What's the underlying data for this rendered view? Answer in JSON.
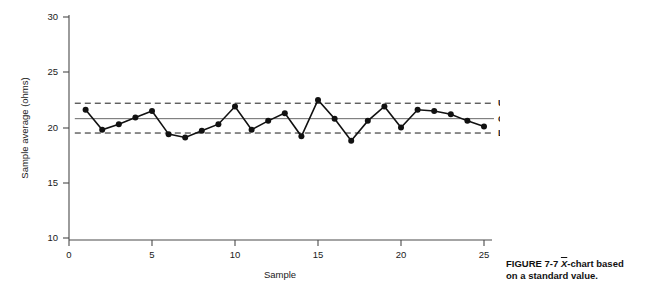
{
  "caption": {
    "figure_number": "FIGURE 7-7",
    "symbol": "X",
    "text_after_symbol": "-chart based",
    "line2": "on a standard value."
  },
  "chart_data": {
    "type": "line",
    "title": "",
    "xlabel": "Sample",
    "ylabel": "Sample average (ohms)",
    "xlim": [
      0,
      25.8
    ],
    "ylim": [
      10,
      30
    ],
    "xticks": [
      0,
      5,
      10,
      15,
      20,
      25
    ],
    "xtick_labels": [
      "0",
      "5",
      "10",
      "15",
      "20",
      "25"
    ],
    "yticks": [
      10,
      15,
      20,
      25,
      30
    ],
    "ytick_labels": [
      "10",
      "15",
      "20",
      "25",
      "30"
    ],
    "grid": false,
    "legend_position": "none",
    "x": [
      1,
      2,
      3,
      4,
      5,
      6,
      7,
      8,
      9,
      10,
      11,
      12,
      13,
      14,
      15,
      16,
      17,
      18,
      19,
      20,
      21,
      22,
      23,
      24,
      25
    ],
    "values": [
      21.6,
      19.8,
      20.3,
      20.9,
      21.5,
      19.4,
      19.1,
      19.7,
      20.3,
      21.9,
      19.8,
      20.6,
      21.3,
      19.2,
      22.5,
      20.8,
      18.8,
      20.6,
      21.9,
      20.0,
      21.6,
      21.5,
      21.2,
      20.6,
      20.1
    ],
    "series": [
      {
        "name": "Sample average",
        "marker": "filled-circle",
        "values": [
          21.6,
          19.8,
          20.3,
          20.9,
          21.5,
          19.4,
          19.1,
          19.7,
          20.3,
          21.9,
          19.8,
          20.6,
          21.3,
          19.2,
          22.5,
          20.8,
          18.8,
          20.6,
          21.9,
          20.0,
          21.6,
          21.5,
          21.2,
          20.6,
          20.1
        ]
      }
    ],
    "reference_lines": [
      {
        "id": "ucl",
        "label": "UCL",
        "value": 22.2,
        "style": "dashed"
      },
      {
        "id": "cl",
        "label": "CL",
        "value": 20.8,
        "style": "solid"
      },
      {
        "id": "lcl",
        "label": "LCL",
        "value": 19.5,
        "style": "dashed"
      }
    ]
  }
}
